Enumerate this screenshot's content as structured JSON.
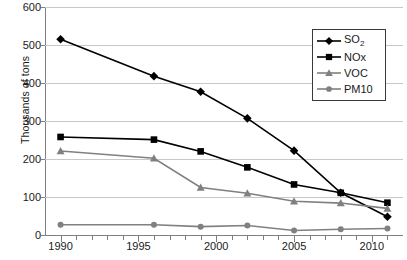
{
  "chart_data": {
    "type": "line",
    "title": "",
    "xlabel": "",
    "ylabel": "Thousands of tons",
    "x": [
      1990,
      1996,
      1999,
      2002,
      2005,
      2008,
      2011
    ],
    "xlim": [
      1989,
      2012
    ],
    "ylim": [
      0,
      600
    ],
    "y_ticks": [
      0,
      100,
      200,
      300,
      400,
      500,
      600
    ],
    "x_tick_labels": [
      "1990",
      "1995",
      "2000",
      "2005",
      "2010"
    ],
    "x_tick_values": [
      1990,
      1995,
      2000,
      2005,
      2010
    ],
    "x_minor_tick_values": [
      1990,
      1991,
      1992,
      1993,
      1994,
      1995,
      1996,
      1997,
      1998,
      1999,
      2000,
      2001,
      2002,
      2003,
      2004,
      2005,
      2006,
      2007,
      2008,
      2009,
      2010,
      2011
    ],
    "grid": "horizontal",
    "legend_position": "top-right",
    "series": [
      {
        "name": "SO2",
        "label": "SO",
        "label_sub": "2",
        "marker": "diamond",
        "color": "#000000",
        "values": [
          515,
          418,
          377,
          307,
          222,
          111,
          48
        ]
      },
      {
        "name": "NOx",
        "label": "NOx",
        "label_sub": "",
        "marker": "square",
        "color": "#000000",
        "values": [
          258,
          251,
          220,
          178,
          133,
          111,
          85
        ]
      },
      {
        "name": "VOC",
        "label": "VOC",
        "label_sub": "",
        "marker": "triangle",
        "color": "#808080",
        "values": [
          221,
          202,
          125,
          110,
          89,
          84,
          70
        ]
      },
      {
        "name": "PM10",
        "label": "PM10",
        "label_sub": "",
        "marker": "circle",
        "color": "#808080",
        "values": [
          27,
          27,
          22,
          25,
          12,
          15,
          17
        ]
      }
    ]
  },
  "axes": {
    "y_title": "Thousands of tons"
  },
  "legend": {
    "entries": [
      {
        "label": "SO",
        "sub": "2",
        "marker": "diamond",
        "color": "#000000"
      },
      {
        "label": "NOx",
        "sub": "",
        "marker": "square",
        "color": "#000000"
      },
      {
        "label": "VOC",
        "sub": "",
        "marker": "triangle",
        "color": "#808080"
      },
      {
        "label": "PM10",
        "sub": "",
        "marker": "circle",
        "color": "#808080"
      }
    ]
  },
  "colors": {
    "gridline": "#c8c8c8",
    "axis": "#808080",
    "text": "#1a1a1a",
    "dark_series": "#000000",
    "gray_series": "#808080",
    "background": "#ffffff"
  }
}
